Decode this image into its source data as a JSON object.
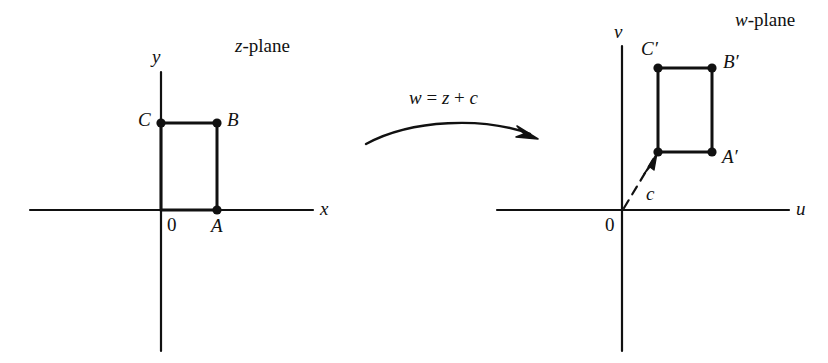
{
  "figure": {
    "caption_absent": true,
    "background_color": "#ffffff",
    "ink_color": "#111111",
    "width": 828,
    "height": 363
  },
  "z_plane": {
    "title": "z-plane",
    "title_italic_part": "z",
    "title_rest": "-plane",
    "x_axis_label": "x",
    "y_axis_label": "y",
    "origin_label": "0",
    "points": [
      {
        "name": "A",
        "label": "A",
        "x": 217,
        "y": 210
      },
      {
        "name": "B",
        "label": "B",
        "x": 217,
        "y": 123
      },
      {
        "name": "C",
        "label": "C",
        "x": 161,
        "y": 123
      }
    ],
    "shape": "rectangle with vertices at origin-side O, A, B, C"
  },
  "w_plane": {
    "title": "w-plane",
    "title_italic_part": "w",
    "title_rest": "-plane",
    "u_axis_label": "u",
    "v_axis_label": "v",
    "origin_label": "0",
    "vector_label": "c",
    "points": [
      {
        "name": "A-prime",
        "label": "A′",
        "x": 712,
        "y": 152
      },
      {
        "name": "B-prime",
        "label": "B′",
        "x": 712,
        "y": 68
      },
      {
        "name": "C-prime",
        "label": "C′",
        "x": 658,
        "y": 68
      },
      {
        "name": "translated-origin",
        "label": "",
        "x": 658,
        "y": 152
      }
    ],
    "shape": "rectangle translated by c"
  },
  "transform": {
    "formula": "w = z + c",
    "formula_lhs": "w",
    "formula_eq": "=",
    "formula_rhs_first": "z",
    "formula_plus": "+",
    "formula_rhs_second": "c",
    "arrow": "curved-right-arrow"
  }
}
